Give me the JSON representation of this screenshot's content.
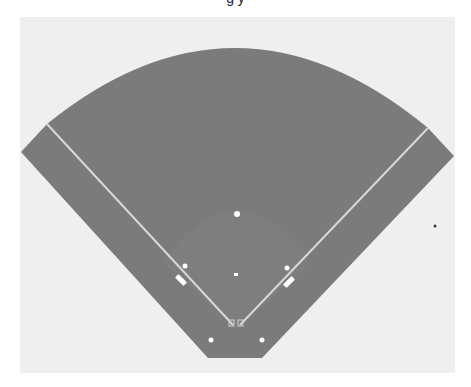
{
  "title_fragment": "g y",
  "colors": {
    "page_background": "#ffffff",
    "panel_background": "#efefef",
    "field_fill": "#7b7b7b",
    "infield_fill": "#808080",
    "foul_line": "#d8d8d8",
    "base_marker": "#ffffff",
    "stray_dot": "#333333"
  },
  "diagram": {
    "type": "baseball-field",
    "elements": [
      {
        "name": "outfield-arc",
        "label": ""
      },
      {
        "name": "left-foul-line",
        "label": ""
      },
      {
        "name": "right-foul-line",
        "label": ""
      },
      {
        "name": "infield-arc",
        "label": ""
      },
      {
        "name": "second-base",
        "label": ""
      },
      {
        "name": "third-base",
        "label": ""
      },
      {
        "name": "first-base",
        "label": ""
      },
      {
        "name": "pitchers-plate",
        "label": ""
      },
      {
        "name": "home-plate",
        "label": ""
      },
      {
        "name": "left-coach-box",
        "label": ""
      },
      {
        "name": "right-coach-box",
        "label": ""
      },
      {
        "name": "left-dugout-marker",
        "label": ""
      },
      {
        "name": "right-dugout-marker",
        "label": ""
      }
    ]
  }
}
